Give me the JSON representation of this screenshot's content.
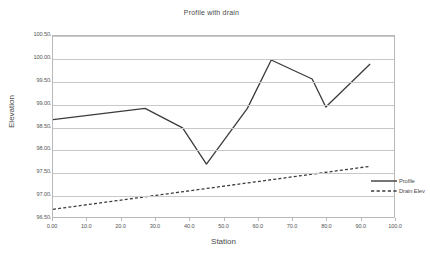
{
  "chart_data": {
    "type": "line",
    "title": "Profile with drain",
    "xlabel": "Station",
    "ylabel": "Elevation",
    "xlim": [
      0.0,
      100.0
    ],
    "ylim": [
      96.5,
      100.5
    ],
    "grid": "horizontal",
    "legend_position": "center-right inside plot",
    "x_tick_labels": [
      "0.00",
      "10.0",
      "20.0",
      "30.0",
      "40.0",
      "50.0",
      "60.0",
      "70.0",
      "80.0",
      "90.0",
      "100.0"
    ],
    "x_ticks": [
      0,
      10,
      20,
      30,
      40,
      50,
      60,
      70,
      80,
      90,
      100
    ],
    "y_tick_labels": [
      "96.50",
      "97.00",
      "97.50",
      "98.00",
      "98.50",
      "99.00",
      "99.50",
      "100.00",
      "100.50"
    ],
    "y_ticks": [
      96.5,
      97.0,
      97.5,
      98.0,
      98.5,
      99.0,
      99.5,
      100.0,
      100.5
    ],
    "series": [
      {
        "name": "Profile",
        "style": "solid",
        "color": "#3b3b3b",
        "x": [
          0.0,
          27.0,
          38.0,
          45.0,
          57.0,
          64.0,
          76.0,
          80.0,
          93.0
        ],
        "values": [
          98.65,
          98.9,
          98.47,
          97.67,
          98.9,
          99.97,
          99.55,
          98.93,
          99.88
        ]
      },
      {
        "name": "Drain Elev",
        "style": "dashed",
        "color": "#3b3b3b",
        "x": [
          0.0,
          93.0
        ],
        "values": [
          96.67,
          97.62
        ]
      }
    ]
  }
}
